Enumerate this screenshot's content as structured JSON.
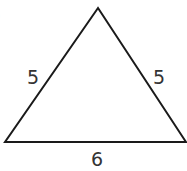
{
  "figure": {
    "type": "triangle",
    "stroke_color": "#1a1a1a",
    "label_color": "#333333",
    "vertices": {
      "apex": [
        98,
        8
      ],
      "bottom_left": [
        5,
        142
      ],
      "bottom_right": [
        187,
        142
      ]
    },
    "sides": {
      "left": {
        "label": "5"
      },
      "right": {
        "label": "5"
      },
      "base": {
        "label": "6"
      }
    },
    "corner_fragment": ")"
  }
}
